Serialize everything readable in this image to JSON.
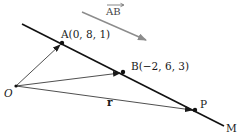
{
  "diagram": {
    "type": "vector-line-diagram",
    "line": {
      "label": "M",
      "color": "#111111"
    },
    "points": {
      "A": {
        "label": "A(0, 8, 1)",
        "coords": [
          0,
          8,
          1
        ]
      },
      "B": {
        "label": "B(−2, 6, 3)",
        "coords": [
          -2,
          6,
          3
        ]
      },
      "P": {
        "label": "P"
      },
      "O": {
        "label": "O"
      }
    },
    "vectors": {
      "r": {
        "label": "r",
        "from": "O",
        "to": "P"
      },
      "OA": {
        "from": "O",
        "to": "A"
      },
      "OB": {
        "from": "O",
        "to": "B"
      }
    },
    "direction_vector": {
      "label": "AB",
      "color": "#888888"
    },
    "colors": {
      "line": "#111111",
      "vectors": "#222222",
      "direction_arrow": "#8c8c8c",
      "text": "#1a1a1a"
    }
  }
}
